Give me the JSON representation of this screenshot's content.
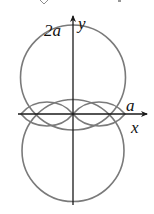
{
  "figure": {
    "type": "polar-curves",
    "labels": {
      "top_intercept": "2a",
      "y_axis": "y",
      "x_intercept": "a",
      "x_axis": "x"
    },
    "colors": {
      "curve": "#7a7a7a",
      "axis": "#1a1a1a",
      "text": "#111111"
    },
    "top_fragment": "(  √  )"
  }
}
